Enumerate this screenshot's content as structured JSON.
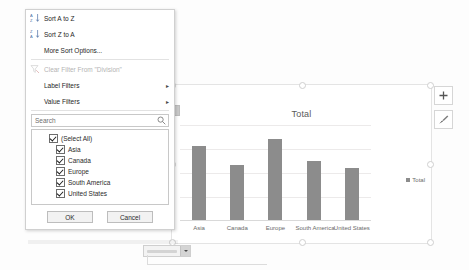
{
  "menu": {
    "items": [
      {
        "id": "sort-az",
        "label": "Sort A to Z",
        "icon": "sort-ascending-icon",
        "disabled": false,
        "submenu": false
      },
      {
        "id": "sort-za",
        "label": "Sort Z to A",
        "icon": "sort-descending-icon",
        "disabled": false,
        "submenu": false
      },
      {
        "id": "more-sort",
        "label": "More Sort Options...",
        "icon": "none",
        "disabled": false,
        "submenu": false
      },
      {
        "id": "clear-filter",
        "label": "Clear Filter From \"Division\"",
        "icon": "clear-filter-icon",
        "disabled": true,
        "submenu": false
      },
      {
        "id": "label-filters",
        "label": "Label Filters",
        "icon": "none",
        "disabled": false,
        "submenu": true
      },
      {
        "id": "value-filters",
        "label": "Value Filters",
        "icon": "none",
        "disabled": false,
        "submenu": true
      }
    ],
    "submenu_arrow": "▸",
    "search": {
      "placeholder": "Search",
      "value": "",
      "icon": "search-icon"
    },
    "checklist": [
      {
        "label": "(Select All)",
        "checked": true,
        "child": false
      },
      {
        "label": "Asia",
        "checked": true,
        "child": true
      },
      {
        "label": "Canada",
        "checked": true,
        "child": true
      },
      {
        "label": "Europe",
        "checked": true,
        "child": true
      },
      {
        "label": "South America",
        "checked": true,
        "child": true
      },
      {
        "label": "United States",
        "checked": true,
        "child": true
      }
    ],
    "buttons": {
      "ok": "OK",
      "cancel": "Cancel"
    }
  },
  "chart": {
    "title": "Total",
    "legend_label": "Total",
    "side_buttons": [
      {
        "id": "chart-elements",
        "icon": "plus-icon"
      },
      {
        "id": "chart-styles",
        "icon": "paintbrush-icon"
      }
    ]
  },
  "chart_data": {
    "type": "bar",
    "title": "Total",
    "categories": [
      "Asia",
      "Canada",
      "Europe",
      "South America",
      "United States"
    ],
    "series": [
      {
        "name": "Total",
        "values": [
          78,
          58,
          85,
          62,
          55
        ],
        "color": "#8c8c8c"
      }
    ],
    "xlabel": "",
    "ylabel": "",
    "ylim": [
      0,
      100
    ],
    "grid": true,
    "gridline_count": 5,
    "legend_position": "right",
    "axis_tick_labels_visible": false
  },
  "colors": {
    "bar": "#8c8c8c",
    "gridline": "#eceaea",
    "menu_border": "#d0d0d0",
    "disabled_text": "#b4b4b4"
  }
}
